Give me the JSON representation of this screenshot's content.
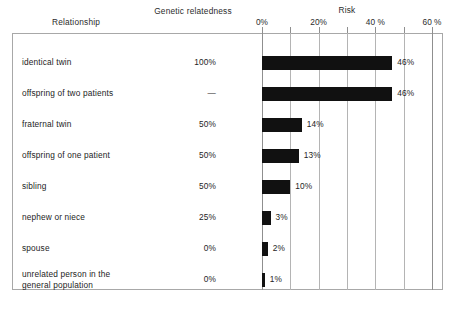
{
  "headers": {
    "relationship": "Relationship",
    "genetic_relatedness": "Genetic\nrelatedness",
    "risk": "Risk"
  },
  "axis": {
    "ticks": [
      {
        "value": 0,
        "label": "0%"
      },
      {
        "value": 10,
        "label": ""
      },
      {
        "value": 20,
        "label": "20%"
      },
      {
        "value": 30,
        "label": ""
      },
      {
        "value": 40,
        "label": "40 %"
      },
      {
        "value": 50,
        "label": ""
      },
      {
        "value": 60,
        "label": "60 %"
      }
    ],
    "min": 0,
    "max": 60
  },
  "chart_data": {
    "type": "bar",
    "title": "Risk",
    "xlabel": "Risk",
    "ylabel": "Relationship",
    "xlim": [
      0,
      60
    ],
    "grid": true,
    "legend": null,
    "orientation": "horizontal",
    "categories": [
      "identical twin",
      "offspring of two patients",
      "fraternal twin",
      "offspring of one patient",
      "sibling",
      "nephew or niece",
      "spouse",
      "unrelated person in the general population"
    ],
    "values": [
      46,
      46,
      14,
      13,
      10,
      3,
      2,
      1
    ],
    "value_labels": [
      "46%",
      "46%",
      "14%",
      "13%",
      "10%",
      "3%",
      "2%",
      "1%"
    ],
    "series": [
      {
        "name": "Risk",
        "values": [
          46,
          46,
          14,
          13,
          10,
          3,
          2,
          1
        ]
      }
    ],
    "annotations": {
      "genetic_relatedness": [
        "100%",
        "—",
        "50%",
        "50%",
        "50%",
        "25%",
        "0%",
        "0%"
      ]
    }
  },
  "rows": [
    {
      "label": "identical twin",
      "relatedness": "100%",
      "risk": 46,
      "risk_label": "46%"
    },
    {
      "label": "offspring of two patients",
      "relatedness": "—",
      "risk": 46,
      "risk_label": "46%"
    },
    {
      "label": "fraternal twin",
      "relatedness": "50%",
      "risk": 14,
      "risk_label": "14%"
    },
    {
      "label": "offspring of one patient",
      "relatedness": "50%",
      "risk": 13,
      "risk_label": "13%"
    },
    {
      "label": "sibling",
      "relatedness": "50%",
      "risk": 10,
      "risk_label": "10%"
    },
    {
      "label": "nephew or niece",
      "relatedness": "25%",
      "risk": 3,
      "risk_label": "3%"
    },
    {
      "label": "spouse",
      "relatedness": "0%",
      "risk": 2,
      "risk_label": "2%"
    },
    {
      "label": "unrelated person in the\ngeneral population",
      "relatedness": "0%",
      "risk": 1,
      "risk_label": "1%"
    }
  ],
  "colors": {
    "bar": "#111111",
    "gridline": "#b4b4b4",
    "frame": "#a8a8a8",
    "text": "#1d1d1d",
    "background": "#ffffff"
  }
}
